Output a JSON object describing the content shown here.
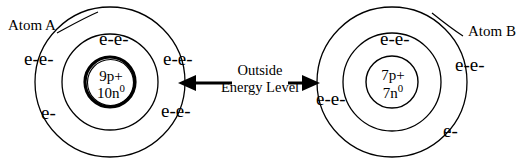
{
  "diagram": {
    "background_color": "#ffffff",
    "stroke_color": "#000000"
  },
  "atom_a": {
    "label": "Atom A",
    "nucleus": {
      "protons": "9p+",
      "neutrons_value": "10n",
      "neutrons_charge": "0"
    },
    "electrons": {
      "top": "e-e-",
      "left": "e-e-",
      "right": "e-e-",
      "bottom_left": "e-",
      "bottom_right": "e-e-"
    }
  },
  "atom_b": {
    "label": "Atom B",
    "nucleus": {
      "protons": "7p+",
      "neutrons_value": "7n",
      "neutrons_charge": "0"
    },
    "electrons": {
      "top": "e-e-",
      "right": "e-e-",
      "left": "e-e-",
      "bottom_right": "e-"
    }
  },
  "center_caption": {
    "line1": "Outside",
    "line2": "Energy Level"
  }
}
